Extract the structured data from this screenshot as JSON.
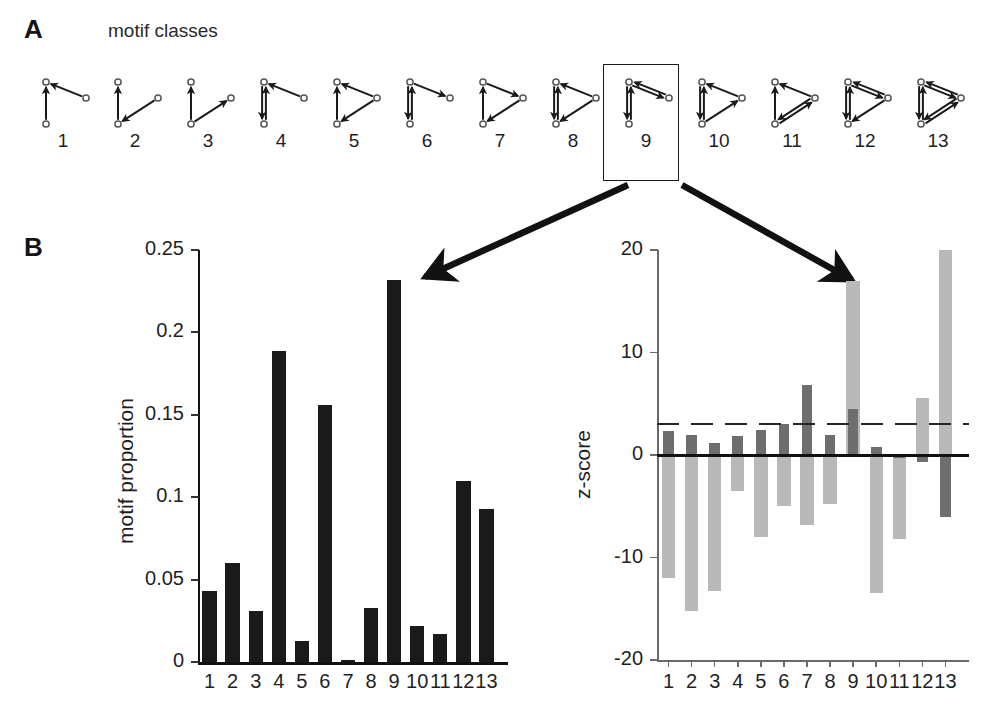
{
  "panels": {
    "a": {
      "letter": "A",
      "title": "motif classes"
    },
    "b": {
      "letter": "B"
    }
  },
  "motifs": {
    "labels": [
      "1",
      "2",
      "3",
      "4",
      "5",
      "6",
      "7",
      "8",
      "9",
      "10",
      "11",
      "12",
      "13"
    ],
    "highlighted": "9",
    "description": "13 directed three-node connectivity motif classes, each drawn as a small node-link diagram with circular nodes and arrowheads indicating connection direction"
  },
  "callouts": {
    "left_arrow": "arrow from highlighted motif 9 box to bar 9 of motif proportion chart",
    "right_arrow": "arrow from highlighted motif 9 box to bar 9 of z-score chart"
  },
  "chart_data": [
    {
      "type": "bar",
      "id": "motif-proportion",
      "title": "",
      "xlabel": "",
      "ylabel": "motif proportion",
      "categories": [
        "1",
        "2",
        "3",
        "4",
        "5",
        "6",
        "7",
        "8",
        "9",
        "10",
        "11",
        "12",
        "13"
      ],
      "values": [
        0.043,
        0.06,
        0.031,
        0.189,
        0.013,
        0.156,
        0.001,
        0.033,
        0.232,
        0.022,
        0.017,
        0.11,
        0.093
      ],
      "ylim": [
        0,
        0.25
      ],
      "yticks": [
        0,
        0.05,
        0.1,
        0.15,
        0.2,
        0.25
      ],
      "ytick_labels": [
        "0",
        "0.05",
        "0.1",
        "0.15",
        "0.2",
        "0.25"
      ],
      "grid": false,
      "legend": "none",
      "bar_color": "#1a1a1a"
    },
    {
      "type": "bar",
      "id": "motif-zscore",
      "title": "",
      "xlabel": "",
      "ylabel": "z-score",
      "categories": [
        "1",
        "2",
        "3",
        "4",
        "5",
        "6",
        "7",
        "8",
        "9",
        "10",
        "11",
        "12",
        "13"
      ],
      "series": [
        {
          "name": "light-series",
          "color": "#b9b9b9",
          "values": [
            -12.0,
            -15.2,
            -13.3,
            -3.5,
            -8.0,
            -5.0,
            -6.8,
            -4.8,
            17.0,
            -13.5,
            -8.2,
            5.6,
            20.0
          ]
        },
        {
          "name": "dark-series",
          "color": "#6e6e6e",
          "values": [
            2.3,
            2.0,
            1.2,
            1.9,
            2.4,
            3.0,
            6.8,
            2.0,
            4.5,
            0.8,
            -0.3,
            -0.7,
            -6.0
          ]
        }
      ],
      "ylim": [
        -20,
        20
      ],
      "yticks": [
        -20,
        -10,
        0,
        10,
        20
      ],
      "ytick_labels": [
        "-20",
        "-10",
        "0",
        "10",
        "20"
      ],
      "threshold_line": {
        "value": 3.0,
        "style": "dashed",
        "color": "#262626"
      },
      "zero_line": {
        "value": 0,
        "style": "solid",
        "color": "#111111"
      },
      "grid": false,
      "legend": "none"
    }
  ]
}
